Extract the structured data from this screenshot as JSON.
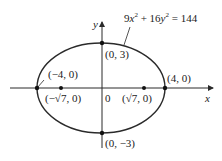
{
  "diagram": {
    "equation": {
      "text": "9x² + 16y² = 144",
      "part1": "9",
      "var1": "x",
      "exp": "2",
      "plus": " + 16",
      "var2": "y",
      "eq": " = 144"
    },
    "axes": {
      "x_label": "x",
      "y_label": "y",
      "origin_label": "0"
    },
    "points": {
      "top": "(0, 3)",
      "bottom": "(0, −3)",
      "left_vertex": "(−4, 0)",
      "right_vertex": "(4, 0)",
      "left_focus": "(−√7, 0)",
      "right_focus": "(√7, 0)"
    },
    "colors": {
      "stroke": "#2a2a2a",
      "text": "#222222",
      "background": "#ffffff"
    }
  }
}
